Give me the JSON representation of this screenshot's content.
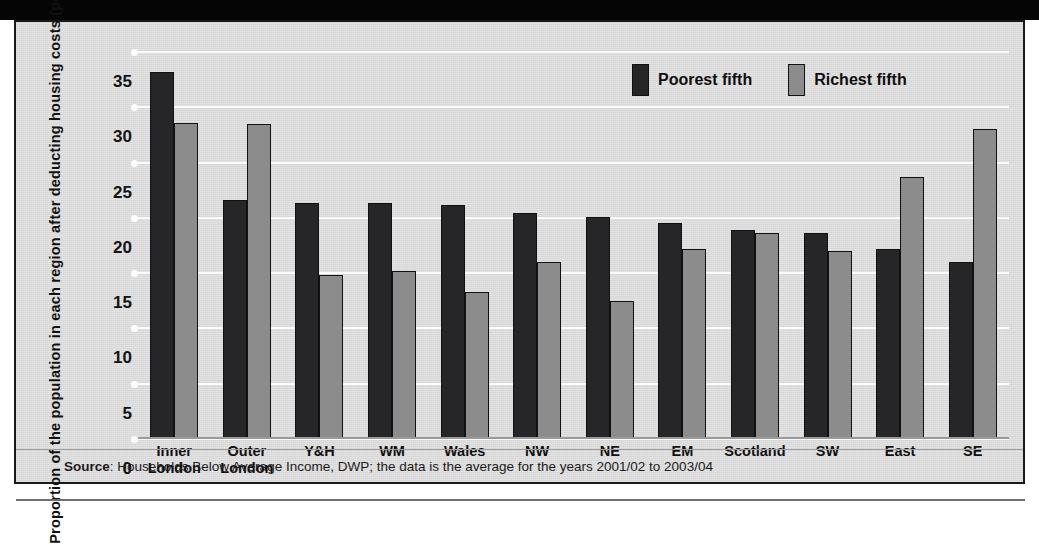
{
  "figure": {
    "y_axis_title": "Proportion of the population in each region after deducting housing costs (per cent)",
    "source_prefix": "Source",
    "source_text": ": Households Below Average Income, DWP; the data is the average for the years 2001/02 to 2003/04"
  },
  "colors": {
    "poorest": "#262628",
    "richest": "#8c8c8c",
    "panel_background": "#dcdcdc",
    "gridline": "#fbfbfb",
    "frame": "#1a1a1a"
  },
  "chart_data": {
    "type": "bar",
    "title": "",
    "subtitle": "",
    "xlabel": "",
    "ylabel": "Proportion of the population in each region after deducting housing costs (per cent)",
    "ylim": [
      0,
      35
    ],
    "yticks": [
      0,
      5,
      10,
      15,
      20,
      25,
      30,
      35
    ],
    "ytick_labels": [
      "0",
      "5",
      "10",
      "15",
      "20",
      "25",
      "30",
      "35"
    ],
    "grid": true,
    "legend_position": "top-right",
    "categories": [
      "Inner London",
      "Outer London",
      "Y&H",
      "WM",
      "Wales",
      "NW",
      "NE",
      "EM",
      "Scotland",
      "SW",
      "East",
      "SE"
    ],
    "series": [
      {
        "name": "Poorest fifth",
        "color": "#262628",
        "values": [
          33.2,
          21.6,
          21.3,
          21.3,
          21.2,
          20.4,
          20.1,
          19.5,
          18.9,
          18.6,
          17.2,
          16.0
        ]
      },
      {
        "name": "Richest fifth",
        "color": "#8c8c8c",
        "values": [
          28.6,
          28.5,
          14.8,
          15.2,
          13.3,
          16.0,
          12.5,
          17.2,
          18.6,
          17.0,
          23.7,
          28.0
        ]
      }
    ],
    "annotations": []
  }
}
